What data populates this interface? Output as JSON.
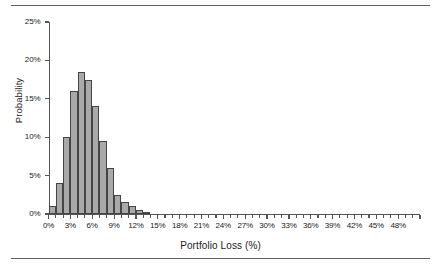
{
  "figure": {
    "top_rule": "horizontal-rule",
    "bottom_rule": "horizontal-rule"
  },
  "chart_data": {
    "type": "bar",
    "title": "",
    "xlabel": "Portfolio Loss (%)",
    "ylabel": "Probability",
    "xlim": [
      0,
      51
    ],
    "ylim": [
      0,
      25
    ],
    "grid": false,
    "legend": null,
    "bar_width": 1,
    "x_major_step": 3,
    "x_minor_step": 1,
    "y_major_step": 5,
    "xtick_labels": [
      "0%",
      "3%",
      "6%",
      "9%",
      "12%",
      "15%",
      "18%",
      "21%",
      "24%",
      "27%",
      "30%",
      "33%",
      "36%",
      "39%",
      "42%",
      "45%",
      "48%"
    ],
    "xtick_values": [
      0,
      3,
      6,
      9,
      12,
      15,
      18,
      21,
      24,
      27,
      30,
      33,
      36,
      39,
      42,
      45,
      48
    ],
    "ytick_labels": [
      "0%",
      "5%",
      "10%",
      "15%",
      "20%",
      "25%"
    ],
    "ytick_values": [
      0,
      5,
      10,
      15,
      20,
      25
    ],
    "categories": [
      0,
      1,
      2,
      3,
      4,
      5,
      6,
      7,
      8,
      9,
      10,
      11,
      12,
      13,
      14,
      15,
      16,
      17,
      18,
      19,
      20,
      21,
      22,
      23,
      24,
      25,
      26,
      27,
      28,
      29,
      30,
      31,
      32,
      33,
      34,
      35,
      36,
      37,
      38,
      39,
      40,
      41,
      42,
      43,
      44,
      45,
      46,
      47,
      48,
      49,
      50
    ],
    "values": [
      1.0,
      4.0,
      10.0,
      16.0,
      18.5,
      17.5,
      14.0,
      9.5,
      6.0,
      2.5,
      1.5,
      1.0,
      0.5,
      0.3,
      0,
      0,
      0,
      0,
      0,
      0,
      0,
      0,
      0,
      0,
      0,
      0,
      0,
      0,
      0,
      0,
      0,
      0,
      0,
      0,
      0,
      0,
      0,
      0,
      0,
      0,
      0,
      0,
      0,
      0,
      0,
      0,
      0,
      0,
      0,
      0,
      0
    ],
    "bar_fill_color": "#a9a9a9",
    "bar_edge_color": "#454545",
    "axis_color": "#555555",
    "background_color": "#ffffff"
  }
}
